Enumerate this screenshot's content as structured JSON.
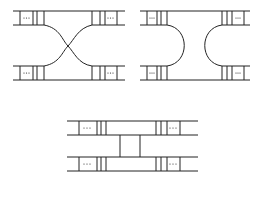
{
  "diagram": {
    "panels": [
      {
        "name": "crossed-ladders",
        "position": "top-left"
      },
      {
        "name": "turnaround-ladders",
        "position": "top-right"
      },
      {
        "name": "rung-connected-ladders",
        "position": "bottom-center"
      }
    ],
    "ellipsis": "···",
    "line_color": "#222222",
    "background": "#ffffff"
  }
}
